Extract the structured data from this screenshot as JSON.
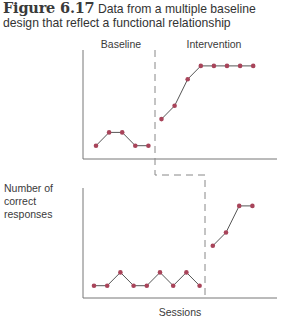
{
  "caption": {
    "figure_label": "Figure 6.17",
    "text": "Data from a multiple baseline design that reflect a functional relationship"
  },
  "colors": {
    "marker": "#a8445a",
    "line": "#555555",
    "axis": "#777777",
    "phase_line": "#888888"
  },
  "chart_data": [
    {
      "type": "line",
      "panel": "top",
      "title": "",
      "phase_labels": [
        "Baseline",
        "Intervention"
      ],
      "xlabel": "",
      "ylabel": "Number of correct responses",
      "grid": false,
      "phase_change_after_session": 5,
      "series": [
        {
          "name": "Baseline",
          "x": [
            1,
            2,
            3,
            4,
            5
          ],
          "values": [
            1,
            2,
            2,
            1,
            1
          ]
        },
        {
          "name": "Intervention",
          "x": [
            6,
            7,
            8,
            9,
            10,
            11,
            12,
            13
          ],
          "values": [
            3,
            4,
            6,
            7,
            7,
            7,
            7,
            7
          ]
        }
      ],
      "ylim": [
        0,
        8
      ]
    },
    {
      "type": "line",
      "panel": "bottom",
      "title": "",
      "xlabel": "Sessions",
      "ylabel": "Number of correct responses",
      "grid": false,
      "phase_change_after_session": 9,
      "series": [
        {
          "name": "Baseline",
          "x": [
            1,
            2,
            3,
            4,
            5,
            6,
            7,
            8,
            9
          ],
          "values": [
            1,
            1,
            2,
            1,
            1,
            2,
            1,
            2,
            1
          ]
        },
        {
          "name": "Intervention",
          "x": [
            10,
            11,
            12,
            13
          ],
          "values": [
            4,
            5,
            7,
            7
          ]
        }
      ],
      "ylim": [
        0,
        8
      ]
    }
  ],
  "labels": {
    "baseline": "Baseline",
    "intervention": "Intervention",
    "ylabel_line1": "Number of",
    "ylabel_line2": "correct",
    "ylabel_line3": "responses",
    "xlabel": "Sessions"
  }
}
